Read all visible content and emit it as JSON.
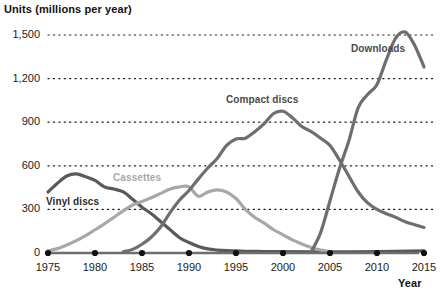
{
  "chart_data": {
    "type": "line",
    "title": "",
    "ylabel": "Units (millions per year)",
    "xlabel": "Year",
    "xlim": [
      1975,
      2015
    ],
    "ylim": [
      0,
      1500
    ],
    "grid": true,
    "legend_position": "inline-labels",
    "y_ticks": [
      "0",
      "300",
      "600",
      "900",
      "1,200",
      "1,500"
    ],
    "y_tick_values": [
      0,
      300,
      600,
      900,
      1200,
      1500
    ],
    "x_ticks": [
      "1975",
      "1980",
      "1985",
      "1990",
      "1995",
      "2000",
      "2005",
      "2010",
      "2015"
    ],
    "x_tick_values": [
      1975,
      1980,
      1985,
      1990,
      1995,
      2000,
      2005,
      2010,
      2015
    ],
    "series": [
      {
        "name": "Vinyl discs",
        "color": "#595959",
        "label_color": "#2b2b2b",
        "x": [
          1975,
          1976,
          1977,
          1978,
          1979,
          1980,
          1981,
          1982,
          1983,
          1984,
          1985,
          1986,
          1987,
          1988,
          1989,
          1990,
          1991,
          1992,
          1993,
          1994,
          1995,
          1996,
          1997,
          1998,
          2000,
          2005,
          2010,
          2015
        ],
        "values": [
          420,
          480,
          530,
          545,
          525,
          500,
          455,
          440,
          420,
          370,
          315,
          270,
          215,
          160,
          105,
          72,
          45,
          28,
          20,
          16,
          14,
          12,
          11,
          10,
          9,
          8,
          10,
          14
        ]
      },
      {
        "name": "Cassettes",
        "color": "#a8a8a8",
        "label_color": "#a8a8a8",
        "x": [
          1975,
          1976,
          1977,
          1978,
          1979,
          1980,
          1981,
          1982,
          1983,
          1984,
          1985,
          1986,
          1987,
          1988,
          1989,
          1990,
          1991,
          1992,
          1993,
          1994,
          1995,
          1996,
          1997,
          1998,
          1999,
          2000,
          2001,
          2002,
          2003,
          2004,
          2005
        ],
        "values": [
          15,
          30,
          55,
          85,
          120,
          160,
          200,
          245,
          290,
          330,
          355,
          380,
          410,
          440,
          455,
          455,
          390,
          420,
          435,
          420,
          375,
          300,
          245,
          205,
          160,
          125,
          90,
          62,
          38,
          20,
          10
        ]
      },
      {
        "name": "Compact discs",
        "color": "#6e6e6e",
        "label_color": "#4a4a4a",
        "x": [
          1983,
          1984,
          1985,
          1986,
          1987,
          1988,
          1989,
          1990,
          1991,
          1992,
          1993,
          1994,
          1995,
          1996,
          1997,
          1998,
          1999,
          2000,
          2001,
          2002,
          2003,
          2004,
          2005,
          2006,
          2007,
          2008,
          2009,
          2010,
          2011,
          2012,
          2013,
          2014,
          2015
        ],
        "values": [
          8,
          25,
          60,
          110,
          180,
          280,
          365,
          430,
          510,
          585,
          650,
          740,
          785,
          790,
          835,
          890,
          960,
          975,
          930,
          870,
          835,
          790,
          740,
          640,
          530,
          420,
          345,
          300,
          270,
          245,
          215,
          195,
          175
        ]
      },
      {
        "name": "Downloads",
        "color": "#6e6e6e",
        "label_color": "#4a4a4a",
        "x": [
          2003,
          2004,
          2005,
          2006,
          2007,
          2008,
          2009,
          2010,
          2011,
          2012,
          2013,
          2014,
          2015
        ],
        "values": [
          8,
          140,
          360,
          580,
          770,
          1000,
          1090,
          1160,
          1330,
          1480,
          1520,
          1430,
          1280
        ]
      }
    ],
    "series_label_positions": [
      {
        "name": "Vinyl discs",
        "x": 46,
        "y": 196
      },
      {
        "name": "Cassettes",
        "x": 113,
        "y": 172
      },
      {
        "name": "Compact discs",
        "x": 226,
        "y": 94
      },
      {
        "name": "Downloads",
        "x": 351,
        "y": 43
      }
    ]
  }
}
